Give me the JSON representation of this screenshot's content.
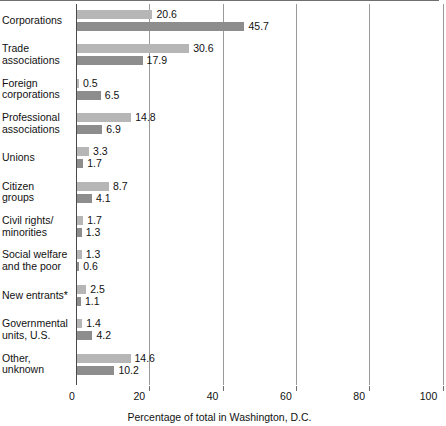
{
  "chart_data": {
    "type": "bar",
    "orientation": "horizontal",
    "title": "",
    "xlabel": "Percentage of total in Washington, D.C.",
    "ylabel": "",
    "xlim": [
      0,
      100
    ],
    "xticks": [
      0,
      20,
      40,
      60,
      80,
      100
    ],
    "xtick_labels": [
      "0",
      "20",
      "40",
      "60",
      "80",
      "100"
    ],
    "grid": "vertical",
    "legend_position": "none",
    "categories": [
      "Corporations",
      "Trade associations",
      "Foreign corporations",
      "Professional associations",
      "Unions",
      "Citizen groups",
      "Civil rights/ minorities",
      "Social welfare and the poor",
      "New entrants*",
      "Governmental units, U.S.",
      "Other, unknown"
    ],
    "category_lines": [
      [
        "Corporations"
      ],
      [
        "Trade",
        "associations"
      ],
      [
        "Foreign",
        "corporations"
      ],
      [
        "Professional",
        "associations"
      ],
      [
        "Unions"
      ],
      [
        "Citizen",
        "groups"
      ],
      [
        "Civil rights/",
        "minorities"
      ],
      [
        "Social welfare",
        "and the poor"
      ],
      [
        "New entrants*"
      ],
      [
        "Governmental",
        "units, U.S."
      ],
      [
        "Other,",
        "unknown"
      ]
    ],
    "series": [
      {
        "name": "series-light",
        "color": "#b6b6b6",
        "values": [
          20.6,
          30.6,
          0.5,
          14.8,
          3.3,
          8.7,
          1.7,
          1.3,
          2.5,
          1.4,
          14.6
        ]
      },
      {
        "name": "series-dark",
        "color": "#8d8d8d",
        "values": [
          45.7,
          17.9,
          6.5,
          6.9,
          1.7,
          4.1,
          1.3,
          0.6,
          1.1,
          4.2,
          10.2
        ]
      }
    ],
    "value_labels": [
      [
        "20.6",
        "45.7"
      ],
      [
        "30.6",
        "17.9"
      ],
      [
        "0.5",
        "6.5"
      ],
      [
        "14.8",
        "6.9"
      ],
      [
        "3.3",
        "1.7"
      ],
      [
        "8.7",
        "4.1"
      ],
      [
        "1.7",
        "1.3"
      ],
      [
        "1.3",
        "0.6"
      ],
      [
        "2.5",
        "1.1"
      ],
      [
        "1.4",
        "4.2"
      ],
      [
        "14.6",
        "10.2"
      ]
    ]
  },
  "colors": {
    "light_bar": "#b6b6b6",
    "dark_bar": "#8d8d8d",
    "gridline": "#9a9a9a",
    "axis": "#4a4a4a",
    "text": "#111111",
    "background": "#ffffff"
  }
}
